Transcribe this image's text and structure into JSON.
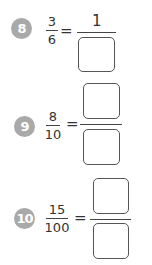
{
  "exercises": [
    {
      "number": "8",
      "left": {
        "numerator": "3",
        "denominator": "6"
      },
      "equals": "=",
      "right": {
        "numerator": "1",
        "denominator": ""
      }
    },
    {
      "number": "9",
      "left": {
        "numerator": "8",
        "denominator": "10"
      },
      "equals": "=",
      "right": {
        "numerator": "",
        "denominator": ""
      }
    },
    {
      "number": "10",
      "left": {
        "numerator": "15",
        "denominator": "100"
      },
      "equals": "=",
      "right": {
        "numerator": "",
        "denominator": ""
      }
    }
  ],
  "colors": {
    "number_badge": "#a9a9a9",
    "text": "#333333",
    "box_border": "#555555"
  }
}
